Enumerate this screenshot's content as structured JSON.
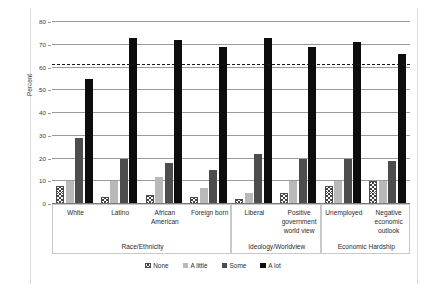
{
  "chart_data": {
    "type": "bar",
    "title": "",
    "xlabel": "",
    "ylabel": "Percent",
    "ylim": [
      0,
      80
    ],
    "ytick_step": 10,
    "yticks": [
      0,
      10,
      20,
      30,
      40,
      50,
      60,
      70,
      80
    ],
    "grid": true,
    "legend_position": "bottom",
    "categories": [
      "White",
      "Latino",
      "African American",
      "Foreign born",
      "Liberal",
      "Positive government world view",
      "Unemployed",
      "Negative economic outlook"
    ],
    "groups": [
      {
        "name": "Race/Ethnicity",
        "categories": [
          "White",
          "Latino",
          "African American",
          "Foreign born"
        ]
      },
      {
        "name": "Ideology/Worldview",
        "categories": [
          "Liberal",
          "Positive government world view"
        ]
      },
      {
        "name": "Economic Hardship",
        "categories": [
          "Unemployed",
          "Negative economic outlook"
        ]
      }
    ],
    "series": [
      {
        "name": "None",
        "key": "none",
        "color": "#ffffff",
        "pattern": "crosshatch",
        "values": [
          8,
          3,
          4,
          3,
          2,
          5,
          8,
          10
        ]
      },
      {
        "name": "A little",
        "key": "alittle",
        "color": "#b9b9b9",
        "pattern": "solid",
        "values": [
          10,
          10,
          12,
          7,
          5,
          10,
          10,
          10
        ]
      },
      {
        "name": "Some",
        "key": "some",
        "color": "#4d4d4d",
        "pattern": "solid",
        "values": [
          29,
          20,
          18,
          15,
          22,
          20,
          20,
          19
        ]
      },
      {
        "name": "A lot",
        "key": "alot",
        "color": "#0d0d0d",
        "pattern": "solid",
        "values": [
          55,
          73,
          72,
          69,
          73,
          69,
          71,
          66
        ]
      }
    ],
    "reference_line": {
      "value": 61,
      "style": "dashed",
      "color": "#1a1a1a"
    },
    "annotations": []
  },
  "legend": {
    "items": [
      {
        "label": "None"
      },
      {
        "label": "A little"
      },
      {
        "label": "Some"
      },
      {
        "label": "A lot"
      }
    ]
  },
  "axis": {
    "y_title": "Percent",
    "tick_labels": [
      "0",
      "10",
      "20",
      "30",
      "40",
      "50",
      "60",
      "70",
      "80"
    ]
  },
  "cat_labels": {
    "white": "White",
    "latino": "Latino",
    "african_american": "African American",
    "foreign_born": "Foreign born",
    "liberal": "Liberal",
    "positive_gov": "Positive government world view",
    "unemployed": "Unemployed",
    "negative_econ": "Negative economic outlook"
  },
  "group_labels": {
    "race": "Race/Ethnicity",
    "ideology": "Ideology/Worldview",
    "hardship": "Economic Hardship"
  }
}
